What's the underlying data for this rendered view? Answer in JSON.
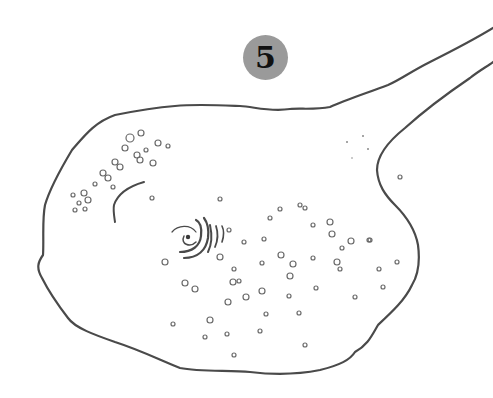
{
  "figure": {
    "label": "5",
    "colors": {
      "badge": "#9a9a9a",
      "ink": "#4a4a4a",
      "background": "#ffffff"
    }
  },
  "spots": [
    [
      130,
      138,
      4
    ],
    [
      141,
      133,
      3
    ],
    [
      125,
      148,
      3
    ],
    [
      146,
      150,
      2
    ],
    [
      137,
      155,
      3
    ],
    [
      158,
      143,
      3
    ],
    [
      168,
      146,
      2
    ],
    [
      153,
      163,
      3
    ],
    [
      140,
      160,
      3
    ],
    [
      115,
      162,
      3
    ],
    [
      120,
      167,
      3
    ],
    [
      103,
      173,
      3
    ],
    [
      108,
      178,
      3
    ],
    [
      95,
      184,
      2
    ],
    [
      113,
      187,
      2
    ],
    [
      73,
      195,
      2
    ],
    [
      84,
      193,
      3
    ],
    [
      79,
      203,
      2
    ],
    [
      88,
      200,
      3
    ],
    [
      75,
      210,
      2
    ],
    [
      85,
      209,
      2
    ],
    [
      152,
      198,
      2
    ],
    [
      220,
      199,
      2
    ],
    [
      280,
      209,
      2
    ],
    [
      270,
      218,
      2
    ],
    [
      300,
      205,
      2
    ],
    [
      305,
      208,
      2
    ],
    [
      330,
      222,
      3
    ],
    [
      313,
      225,
      2
    ],
    [
      281,
      255,
      3
    ],
    [
      293,
      264,
      3
    ],
    [
      332,
      234,
      3
    ],
    [
      369,
      240,
      2
    ],
    [
      351,
      241,
      3
    ],
    [
      342,
      248,
      2
    ],
    [
      313,
      258,
      2
    ],
    [
      264,
      239,
      2
    ],
    [
      262,
      263,
      2
    ],
    [
      220,
      257,
      3
    ],
    [
      233,
      282,
      3
    ],
    [
      234,
      269,
      2
    ],
    [
      239,
      281,
      2
    ],
    [
      244,
      242,
      2
    ],
    [
      246,
      297,
      3
    ],
    [
      262,
      291,
      3
    ],
    [
      289,
      296,
      2
    ],
    [
      266,
      314,
      2
    ],
    [
      228,
      302,
      3
    ],
    [
      185,
      283,
      3
    ],
    [
      165,
      262,
      3
    ],
    [
      195,
      289,
      3
    ],
    [
      173,
      324,
      2
    ],
    [
      210,
      320,
      3
    ],
    [
      227,
      334,
      2
    ],
    [
      205,
      337,
      2
    ],
    [
      234,
      355,
      2
    ],
    [
      383,
      287,
      2
    ],
    [
      397,
      262,
      2
    ],
    [
      337,
      262,
      3
    ],
    [
      370,
      240,
      2
    ],
    [
      379,
      269,
      2
    ],
    [
      340,
      269,
      2
    ],
    [
      299,
      313,
      2
    ],
    [
      260,
      331,
      2
    ],
    [
      305,
      345,
      2
    ],
    [
      355,
      297,
      2
    ],
    [
      316,
      288,
      2
    ],
    [
      290,
      276,
      3
    ],
    [
      229,
      230,
      2
    ],
    [
      400,
      177,
      2
    ]
  ]
}
